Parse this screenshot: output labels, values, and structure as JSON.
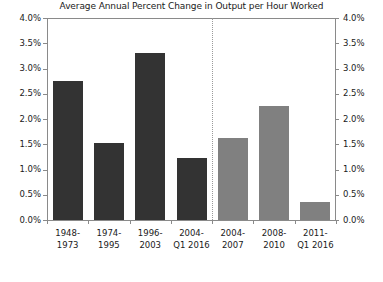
{
  "chart_data": {
    "type": "bar",
    "title": "Average Annual Percent Change in Output per Hour Worked",
    "xlabel": "",
    "ylabel": "",
    "ylim": [
      0,
      4.0
    ],
    "grid": false,
    "legend": null,
    "axis_tick_format": "percent",
    "left_axis_ticks": [
      "0.0%",
      "0.5%",
      "1.0%",
      "1.5%",
      "2.0%",
      "2.5%",
      "3.0%",
      "3.5%",
      "4.0%"
    ],
    "right_axis_ticks": [
      "0.0%",
      "0.5%",
      "1.0%",
      "1.5%",
      "2.0%",
      "2.5%",
      "3.0%",
      "3.5%",
      "4.0%"
    ],
    "tick_values": [
      0,
      0.5,
      1.0,
      1.5,
      2.0,
      2.5,
      3.0,
      3.5,
      4.0
    ],
    "categories": [
      "1948-1973",
      "1974-1995",
      "1996-2003",
      "2004-Q1 2016",
      "2004-2007",
      "2008-2010",
      "2011-Q1 2016"
    ],
    "values": [
      2.75,
      1.52,
      3.3,
      1.22,
      1.62,
      2.25,
      0.35
    ],
    "groups": [
      {
        "name": "long-run-periods",
        "color": "#333333",
        "indices": [
          0,
          1,
          2,
          3
        ]
      },
      {
        "name": "recent-subperiods",
        "color": "#808080",
        "indices": [
          4,
          5,
          6
        ]
      }
    ],
    "annotations": [
      {
        "type": "vertical-divider",
        "style": "dotted",
        "after_category_index": 3
      }
    ]
  },
  "category_labels": [
    [
      "1948-",
      "1973"
    ],
    [
      "1974-",
      "1995"
    ],
    [
      "1996-",
      "2003"
    ],
    [
      "2004-",
      "Q1 2016"
    ],
    [
      "2004-",
      "2007"
    ],
    [
      "2008-",
      "2010"
    ],
    [
      "2011-",
      "Q1 2016"
    ]
  ]
}
